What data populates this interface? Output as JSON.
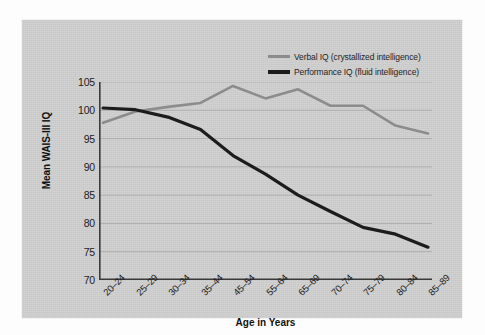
{
  "chart_data": {
    "type": "line",
    "title": "",
    "xlabel": "Age in Years",
    "ylabel": "Mean WAIS-III IQ",
    "categories": [
      "20–24",
      "25–29",
      "30–34",
      "35–44",
      "45–54",
      "55–64",
      "65–69",
      "70–74",
      "75–79",
      "80–84",
      "85–89"
    ],
    "ylim": [
      70,
      105
    ],
    "yticks": [
      70,
      75,
      80,
      85,
      90,
      95,
      100,
      105
    ],
    "grid": true,
    "legend_position": "top-right",
    "series": [
      {
        "name": "Verbal IQ (crystallized intelligence)",
        "color": "#8c8c8c",
        "values": [
          97.8,
          99.8,
          100.6,
          101.3,
          104.3,
          102.1,
          103.7,
          100.8,
          100.8,
          97.3,
          95.9
        ]
      },
      {
        "name": "Performance IQ (fluid intelligence)",
        "color": "#1c1c1c",
        "values": [
          100.4,
          100.1,
          98.8,
          96.6,
          92.0,
          88.7,
          85.0,
          82.1,
          79.3,
          78.1,
          75.8
        ]
      }
    ]
  },
  "legend": {
    "items": [
      {
        "label": "Verbal IQ (crystallized intelligence)"
      },
      {
        "label": "Performance IQ (fluid intelligence)"
      }
    ]
  }
}
